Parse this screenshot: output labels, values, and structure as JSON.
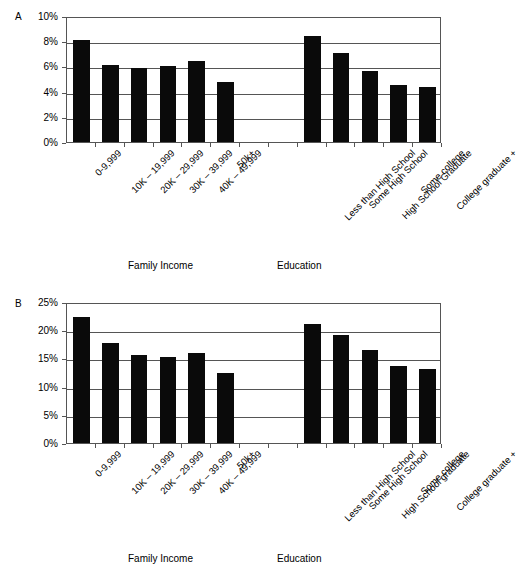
{
  "figure": {
    "panels": [
      {
        "letter": "A",
        "group_titles": {
          "income": "Family Income",
          "education": "Education"
        },
        "y_ticks": [
          "0%",
          "2%",
          "4%",
          "6%",
          "8%",
          "10%"
        ]
      },
      {
        "letter": "B",
        "group_titles": {
          "income": "Family Income",
          "education": "Education"
        },
        "y_ticks": [
          "0%",
          "5%",
          "10%",
          "15%",
          "20%",
          "25%"
        ]
      }
    ]
  },
  "chart_data": [
    {
      "type": "bar",
      "panel": "A",
      "title": "",
      "xlabel": "",
      "ylabel": "",
      "ylim": [
        0,
        10
      ],
      "ytick_values": [
        0,
        2,
        4,
        6,
        8,
        10
      ],
      "ytick_labels": [
        "0%",
        "2%",
        "4%",
        "6%",
        "8%",
        "10%"
      ],
      "grid": true,
      "legend": "none",
      "groups": [
        {
          "name": "Family Income",
          "categories": [
            "0-9,999",
            "10K – 19,999",
            "20K – 29,999",
            "30K – 39,999",
            "40K – 49,999",
            "50k+"
          ],
          "values": [
            8.1,
            6.1,
            5.85,
            6.0,
            6.4,
            4.75
          ]
        },
        {
          "name": "Education",
          "categories": [
            "Less than High School",
            "Some High School",
            "High School Graduate",
            "Some college",
            "College graduate +"
          ],
          "values": [
            8.45,
            7.1,
            5.65,
            4.55,
            4.4
          ]
        }
      ]
    },
    {
      "type": "bar",
      "panel": "B",
      "title": "",
      "xlabel": "",
      "ylabel": "",
      "ylim": [
        0,
        25
      ],
      "ytick_values": [
        0,
        5,
        10,
        15,
        20,
        25
      ],
      "ytick_labels": [
        "0%",
        "5%",
        "10%",
        "15%",
        "20%",
        "25%"
      ],
      "grid": true,
      "legend": "none",
      "groups": [
        {
          "name": "Family Income",
          "categories": [
            "0-9,999",
            "10K – 19,999",
            "20K – 29,999",
            "30K – 39,999",
            "40K – 49,999",
            "50k+"
          ],
          "values": [
            22.3,
            17.8,
            15.6,
            15.3,
            16.0,
            12.5
          ]
        },
        {
          "name": "Education",
          "categories": [
            "Less than High School",
            "Some High School",
            "High School graduate",
            "Some college",
            "College graduate +"
          ],
          "values": [
            21.1,
            19.2,
            16.5,
            13.6,
            13.2
          ]
        }
      ]
    }
  ],
  "colors": {
    "bar": "#0a0a0a",
    "axis": "#555555",
    "background": "#ffffff",
    "text": "#000000"
  }
}
